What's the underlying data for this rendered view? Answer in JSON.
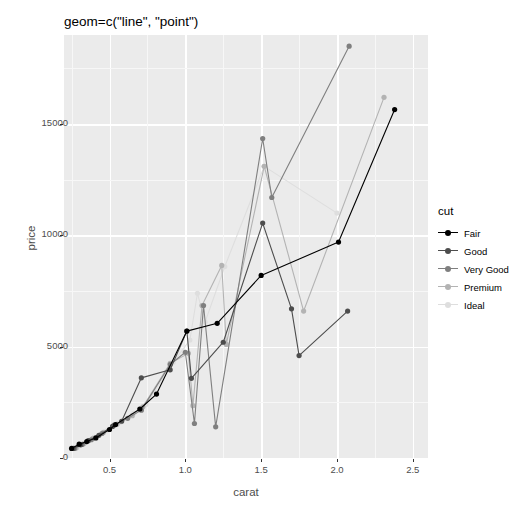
{
  "title": "geom=c(\"line\", \"point\")",
  "axes": {
    "xlabel": "carat",
    "ylabel": "price",
    "x_ticks": [
      "0.5",
      "1.0",
      "1.5",
      "2.0",
      "2.5"
    ],
    "y_ticks": [
      "0",
      "5000",
      "10000",
      "15000"
    ]
  },
  "legend": {
    "title": "cut",
    "items": [
      {
        "label": "Fair",
        "color": "#000000"
      },
      {
        "label": "Good",
        "color": "#4d4d4d"
      },
      {
        "label": "Very Good",
        "color": "#7f7f7f"
      },
      {
        "label": "Premium",
        "color": "#b3b3b3"
      },
      {
        "label": "Ideal",
        "color": "#dedede"
      }
    ]
  },
  "chart_data": {
    "type": "line",
    "title": "geom=c(\"line\", \"point\")",
    "xlabel": "carat",
    "ylabel": "price",
    "xlim": [
      0.2,
      2.6
    ],
    "ylim": [
      0,
      19000
    ],
    "grid": true,
    "legend_position": "right",
    "legend_title": "cut",
    "markers": true,
    "series": [
      {
        "name": "Fair",
        "color": "#000000",
        "points": [
          {
            "x": 0.25,
            "y": 430
          },
          {
            "x": 0.3,
            "y": 620
          },
          {
            "x": 0.35,
            "y": 740
          },
          {
            "x": 0.41,
            "y": 900
          },
          {
            "x": 0.5,
            "y": 1280
          },
          {
            "x": 0.54,
            "y": 1500
          },
          {
            "x": 0.7,
            "y": 2200
          },
          {
            "x": 0.81,
            "y": 2870
          },
          {
            "x": 1.01,
            "y": 5700
          },
          {
            "x": 1.21,
            "y": 6050
          },
          {
            "x": 1.5,
            "y": 8200
          },
          {
            "x": 2.01,
            "y": 9700
          },
          {
            "x": 2.38,
            "y": 15650
          }
        ]
      },
      {
        "name": "Good",
        "color": "#4d4d4d",
        "points": [
          {
            "x": 0.26,
            "y": 430
          },
          {
            "x": 0.31,
            "y": 590
          },
          {
            "x": 0.36,
            "y": 780
          },
          {
            "x": 0.43,
            "y": 1020
          },
          {
            "x": 0.52,
            "y": 1420
          },
          {
            "x": 0.58,
            "y": 1650
          },
          {
            "x": 0.71,
            "y": 3600
          },
          {
            "x": 0.9,
            "y": 3960
          },
          {
            "x": 1.01,
            "y": 5700
          },
          {
            "x": 1.04,
            "y": 3580
          },
          {
            "x": 1.25,
            "y": 5200
          },
          {
            "x": 1.51,
            "y": 10550
          },
          {
            "x": 1.7,
            "y": 6700
          },
          {
            "x": 1.75,
            "y": 4600
          },
          {
            "x": 2.07,
            "y": 6600
          }
        ]
      },
      {
        "name": "Very Good",
        "color": "#7f7f7f",
        "points": [
          {
            "x": 0.27,
            "y": 430
          },
          {
            "x": 0.32,
            "y": 610
          },
          {
            "x": 0.38,
            "y": 820
          },
          {
            "x": 0.45,
            "y": 1100
          },
          {
            "x": 0.53,
            "y": 1480
          },
          {
            "x": 0.62,
            "y": 1780
          },
          {
            "x": 0.71,
            "y": 2150
          },
          {
            "x": 0.9,
            "y": 4200
          },
          {
            "x": 1.0,
            "y": 4750
          },
          {
            "x": 1.06,
            "y": 1550
          },
          {
            "x": 1.12,
            "y": 6850
          },
          {
            "x": 1.2,
            "y": 1400
          },
          {
            "x": 1.51,
            "y": 14350
          },
          {
            "x": 1.57,
            "y": 11700
          },
          {
            "x": 2.08,
            "y": 18500
          }
        ]
      },
      {
        "name": "Premium",
        "color": "#b3b3b3",
        "points": [
          {
            "x": 0.28,
            "y": 450
          },
          {
            "x": 0.33,
            "y": 640
          },
          {
            "x": 0.39,
            "y": 880
          },
          {
            "x": 0.46,
            "y": 1150
          },
          {
            "x": 0.55,
            "y": 1520
          },
          {
            "x": 0.65,
            "y": 1900
          },
          {
            "x": 0.72,
            "y": 2300
          },
          {
            "x": 0.9,
            "y": 4250
          },
          {
            "x": 1.02,
            "y": 4700
          },
          {
            "x": 1.05,
            "y": 2350
          },
          {
            "x": 1.11,
            "y": 6850
          },
          {
            "x": 1.24,
            "y": 8650
          },
          {
            "x": 1.27,
            "y": 5100
          },
          {
            "x": 1.52,
            "y": 13100
          },
          {
            "x": 1.78,
            "y": 6600
          },
          {
            "x": 2.31,
            "y": 16200
          }
        ]
      },
      {
        "name": "Ideal",
        "color": "#dedede",
        "points": [
          {
            "x": 0.29,
            "y": 480
          },
          {
            "x": 0.34,
            "y": 680
          },
          {
            "x": 0.4,
            "y": 930
          },
          {
            "x": 0.48,
            "y": 1220
          },
          {
            "x": 0.57,
            "y": 1600
          },
          {
            "x": 0.66,
            "y": 2000
          },
          {
            "x": 0.74,
            "y": 2400
          },
          {
            "x": 0.92,
            "y": 4300
          },
          {
            "x": 1.03,
            "y": 5300
          },
          {
            "x": 1.08,
            "y": 7400
          },
          {
            "x": 1.13,
            "y": 6100
          },
          {
            "x": 1.26,
            "y": 8600
          },
          {
            "x": 1.52,
            "y": 13100
          },
          {
            "x": 2.0,
            "y": 11000
          }
        ]
      }
    ]
  }
}
